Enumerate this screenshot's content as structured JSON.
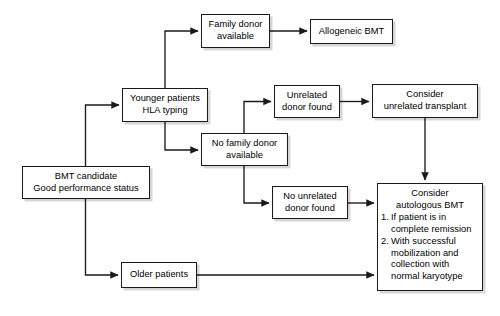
{
  "diagram": {
    "colors": {
      "stroke": "#1a1a1a",
      "box_fill": "#ffffff",
      "text": "#000000",
      "background": "#ffffff",
      "shadow": "rgba(0,0,0,0.16)"
    },
    "nodes": {
      "bmt_candidate": {
        "line1": "BMT candidate",
        "line2": "Good performance status"
      },
      "younger_patients": {
        "line1": "Younger patients",
        "line2": "HLA typing"
      },
      "older_patients": {
        "line1": "Older patients"
      },
      "family_donor": {
        "line1": "Family donor",
        "line2": "available"
      },
      "no_family_donor": {
        "line1": "No family donor",
        "line2": "available"
      },
      "allogeneic_bmt": {
        "line1": "Allogeneic BMT"
      },
      "unrelated_donor_found": {
        "line1": "Unrelated",
        "line2": "donor found"
      },
      "no_unrelated_donor": {
        "line1": "No unrelated",
        "line2": "donor found"
      },
      "consider_unrelated": {
        "line1": "Consider",
        "line2": "unrelated transplant"
      },
      "consider_autologous": {
        "line1": "Consider",
        "line2": "autologous BMT",
        "item1_num": "1.",
        "item1_a": "If patient is in",
        "item1_b": "complete remission",
        "item2_num": "2.",
        "item2_a": "With successful",
        "item2_b": "mobilization and",
        "item2_c": "collection with",
        "item2_d": "normal karyotype"
      }
    }
  }
}
